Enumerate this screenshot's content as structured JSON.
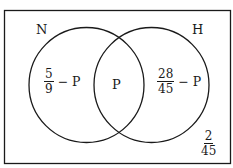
{
  "diagram": {
    "type": "venn",
    "sets": [
      {
        "label": "N",
        "region_expr": {
          "numerator": "5",
          "denominator": "9",
          "suffix": "− P"
        }
      },
      {
        "label": "H",
        "region_expr": {
          "numerator": "28",
          "denominator": "45",
          "suffix": "− P"
        }
      }
    ],
    "intersection": "P",
    "outside": {
      "numerator": "2",
      "denominator": "45"
    },
    "colors": {
      "stroke": "#1a1a1a",
      "background": "#ffffff"
    }
  }
}
